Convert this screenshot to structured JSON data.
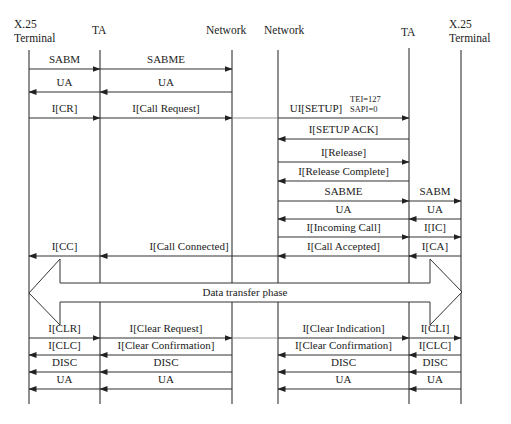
{
  "diagram": {
    "participants": [
      {
        "id": "x25_left",
        "label_line1": "X.25",
        "label_line2": "Terminal",
        "x": 29
      },
      {
        "id": "ta_left",
        "label_line1": "TA",
        "label_line2": "",
        "x": 100
      },
      {
        "id": "net_left",
        "label_line1": "Network",
        "label_line2": "",
        "x": 232
      },
      {
        "id": "net_right",
        "label_line1": "Network",
        "label_line2": "",
        "x": 278
      },
      {
        "id": "ta_right",
        "label_line1": "TA",
        "label_line2": "",
        "x": 409
      },
      {
        "id": "x25_right",
        "label_line1": "X.25",
        "label_line2": "Terminal",
        "x": 461
      }
    ],
    "messages": [
      {
        "label": "SABM",
        "from": 29,
        "to": 100,
        "y": 69
      },
      {
        "label": "SABME",
        "from": 100,
        "to": 232,
        "y": 69
      },
      {
        "label": "UA",
        "from": 100,
        "to": 29,
        "y": 92
      },
      {
        "label": "UA",
        "from": 232,
        "to": 100,
        "y": 92
      },
      {
        "label": "I[CR]",
        "from": 29,
        "to": 100,
        "y": 118
      },
      {
        "label": "I[Call Request]",
        "from": 100,
        "to": 232,
        "y": 118
      },
      {
        "label": "UI[SETUP]",
        "from": 278,
        "to": 409,
        "y": 118,
        "note_line1": "TEI=127",
        "note_line2": "SAPI=0"
      },
      {
        "label": "I[SETUP ACK]",
        "from": 409,
        "to": 278,
        "y": 139
      },
      {
        "label": "I[Release]",
        "from": 278,
        "to": 409,
        "y": 162
      },
      {
        "label": "I[Release Complete]",
        "from": 409,
        "to": 278,
        "y": 181
      },
      {
        "label": "SABME",
        "from": 278,
        "to": 409,
        "y": 201
      },
      {
        "label": "SABM",
        "from": 409,
        "to": 461,
        "y": 201
      },
      {
        "label": "UA",
        "from": 409,
        "to": 278,
        "y": 219
      },
      {
        "label": "UA",
        "from": 461,
        "to": 409,
        "y": 219
      },
      {
        "label": "I[Incoming Call]",
        "from": 278,
        "to": 409,
        "y": 237
      },
      {
        "label": "I[IC]",
        "from": 409,
        "to": 461,
        "y": 237
      },
      {
        "label": "I[CC]",
        "from": 100,
        "to": 29,
        "y": 256
      },
      {
        "label": "I[Call Connected]",
        "from": 278,
        "to": 100,
        "y": 256
      },
      {
        "label": "I[Call Accepted]",
        "from": 409,
        "to": 278,
        "y": 256
      },
      {
        "label": "I[CA]",
        "from": 461,
        "to": 409,
        "y": 256
      },
      {
        "label": "I[CLR]",
        "from": 29,
        "to": 100,
        "y": 338
      },
      {
        "label": "I[Clear Request]",
        "from": 100,
        "to": 232,
        "y": 338
      },
      {
        "label": "I[Clear Indication]",
        "from": 278,
        "to": 409,
        "y": 338
      },
      {
        "label": "I[CLI]",
        "from": 409,
        "to": 461,
        "y": 338
      },
      {
        "label": "I[CLC]",
        "from": 100,
        "to": 29,
        "y": 355
      },
      {
        "label": "I[Clear Confirmation]",
        "from": 232,
        "to": 100,
        "y": 355
      },
      {
        "label": "I[Clear Confirmation]",
        "from": 409,
        "to": 278,
        "y": 355
      },
      {
        "label": "I[CLC]",
        "from": 461,
        "to": 409,
        "y": 355
      },
      {
        "label": "DISC",
        "from": 100,
        "to": 29,
        "y": 372
      },
      {
        "label": "DISC",
        "from": 232,
        "to": 100,
        "y": 372
      },
      {
        "label": "DISC",
        "from": 409,
        "to": 278,
        "y": 372
      },
      {
        "label": "DISC",
        "from": 461,
        "to": 409,
        "y": 372
      },
      {
        "label": "UA",
        "from": 100,
        "to": 29,
        "y": 389
      },
      {
        "label": "UA",
        "from": 232,
        "to": 100,
        "y": 389
      },
      {
        "label": "UA",
        "from": 409,
        "to": 278,
        "y": 389
      },
      {
        "label": "UA",
        "from": 461,
        "to": 409,
        "y": 389
      }
    ],
    "bridges": [
      {
        "from": 232,
        "to": 278,
        "y": 118
      },
      {
        "from": 232,
        "to": 278,
        "y": 338
      }
    ],
    "phase": {
      "label": "Data transfer phase"
    }
  }
}
